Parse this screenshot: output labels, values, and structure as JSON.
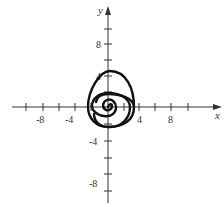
{
  "figure": {
    "type": "polar spiral plot",
    "axes": {
      "x_label": "x",
      "y_label": "y",
      "x_tick_labels": [
        "-8",
        "-4",
        "4",
        "8"
      ],
      "y_tick_labels": [
        "8",
        "4",
        "-4",
        "-8"
      ],
      "x_ticks": [
        -10,
        -8,
        -6,
        -4,
        -2,
        2,
        4,
        6,
        8,
        10
      ],
      "y_ticks": [
        10,
        8,
        6,
        4,
        2,
        -2,
        -4,
        -6,
        -8,
        -10
      ],
      "xlim": [
        -12,
        14
      ],
      "ylim": [
        -12,
        12
      ]
    },
    "curve": {
      "description": "spiral starting at the origin winding counterclockwise outward, about two full turns",
      "approx_crossings": [
        {
          "dir": "up",
          "value": 1.0
        },
        {
          "dir": "left",
          "value": -1.9
        },
        {
          "dir": "down",
          "value": -2.5
        },
        {
          "dir": "right",
          "value": 3.3
        },
        {
          "dir": "up",
          "value": 4.4
        },
        {
          "dir": "left",
          "value": -6.4
        },
        {
          "dir": "down",
          "value": -8.6
        },
        {
          "dir": "right",
          "value": 11.1
        }
      ],
      "color": "#111111"
    }
  }
}
